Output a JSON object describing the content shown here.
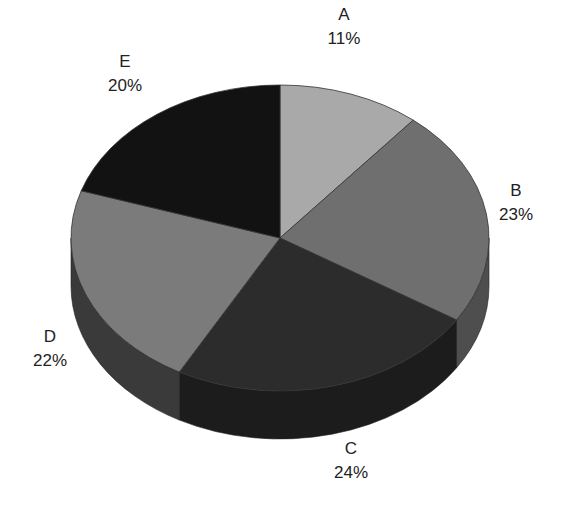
{
  "chart_data": {
    "type": "pie",
    "style": "3d",
    "title": "",
    "categories": [
      "A",
      "B",
      "C",
      "D",
      "E"
    ],
    "values": [
      11,
      23,
      24,
      22,
      20
    ],
    "value_labels": [
      "11%",
      "23%",
      "24%",
      "22%",
      "20%"
    ],
    "colors": [
      "#a9a9a9",
      "#6f6f6f",
      "#2c2c2c",
      "#7b7b7b",
      "#121212"
    ],
    "side_colors": [
      "#8a8a8a",
      "#4e4e4e",
      "#1c1c1c",
      "#3a3a3a",
      "#0a0a0a"
    ],
    "start_angle_deg": 90,
    "direction": "clockwise",
    "legend": "none",
    "label_position": "outside"
  },
  "labels": {
    "A": {
      "name": "A",
      "pct": "11%"
    },
    "B": {
      "name": "B",
      "pct": "23%"
    },
    "C": {
      "name": "C",
      "pct": "24%"
    },
    "D": {
      "name": "D",
      "pct": "22%"
    },
    "E": {
      "name": "E",
      "pct": "20%"
    }
  }
}
